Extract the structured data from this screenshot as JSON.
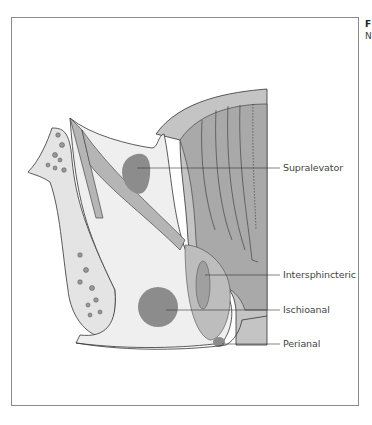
{
  "figure": {
    "caption_fragment_line1": "F",
    "caption_fragment_line2": "N",
    "labels": [
      {
        "id": "supralevator",
        "text": "Supralevator"
      },
      {
        "id": "intersphincteric",
        "text": "Intersphincteric"
      },
      {
        "id": "ischioanal",
        "text": "Ischioanal"
      },
      {
        "id": "perianal",
        "text": "Perianal"
      }
    ],
    "colors": {
      "frame": "#8a8a8a",
      "tissue_light": "#ececec",
      "muscle": "#b5b5b5",
      "abscess": "#8c8c8c",
      "rectum": "#bdbdbd",
      "outline": "#333333"
    }
  }
}
